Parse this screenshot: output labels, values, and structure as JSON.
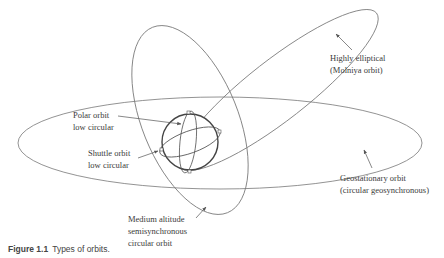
{
  "figure": {
    "caption_number": "Figure 1.1",
    "caption_text": "Types of orbits."
  },
  "labels": {
    "molniya": {
      "line1": "Highly elliptical",
      "line2": "(Molniya orbit)"
    },
    "polar": {
      "line1": "Polar orbit",
      "line2": "low circular"
    },
    "shuttle": {
      "line1": "Shuttle orbit",
      "line2": "low circular"
    },
    "geostationary": {
      "line1": "Geostationary orbit",
      "line2": "(circular geosynchronous)"
    },
    "medium": {
      "line1": "Medium altitude",
      "line2": "semisynchronous",
      "line3": "circular orbit"
    }
  },
  "colors": {
    "line": "#6a6a6a",
    "earth": "#444444",
    "text": "#3a3a3a"
  }
}
